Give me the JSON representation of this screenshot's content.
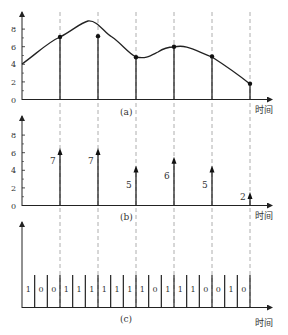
{
  "figure": {
    "x_axis_label": "时间",
    "panels": [
      {
        "id": "a",
        "label": "(a)",
        "type": "continuous analog signal with sample points"
      },
      {
        "id": "b",
        "label": "(b)",
        "type": "sampled values (impulses)"
      },
      {
        "id": "c",
        "label": "(c)",
        "type": "binary encoded bit stream"
      }
    ],
    "y_ticks": [
      "0",
      "2",
      "4",
      "6",
      "8"
    ],
    "samples": [
      7,
      7,
      5,
      6,
      5,
      2
    ],
    "sample_labels": [
      "7",
      "7",
      "5",
      "6",
      "5",
      "2"
    ],
    "bits": [
      "1",
      "0",
      "0",
      "1",
      "1",
      "1",
      "1",
      "1",
      "1",
      "1",
      "0",
      "1",
      "1",
      "1",
      "0",
      "0",
      "1",
      "0"
    ],
    "colors": {
      "line": "#222222",
      "dashed": "#888888",
      "text": "#333333"
    }
  },
  "chart_data": [
    {
      "type": "line",
      "title": "(a)",
      "xlabel": "时间",
      "ylabel": "",
      "ylim": [
        0,
        8.5
      ],
      "y_ticks": [
        0,
        2,
        4,
        6,
        8
      ],
      "curve_approx": [
        {
          "t": 0,
          "y": 4.0
        },
        {
          "t": 1,
          "y": 7.1
        },
        {
          "t": 1.5,
          "y": 7.9
        },
        {
          "t": 2,
          "y": 7.2
        },
        {
          "t": 3,
          "y": 4.8
        },
        {
          "t": 3.5,
          "y": 5.0
        },
        {
          "t": 4,
          "y": 6.0
        },
        {
          "t": 4.4,
          "y": 6.2
        },
        {
          "t": 5,
          "y": 4.9
        },
        {
          "t": 6,
          "y": 1.8
        }
      ],
      "sample_points": [
        {
          "t": 1,
          "y": 7.1
        },
        {
          "t": 2,
          "y": 7.2
        },
        {
          "t": 3,
          "y": 4.8
        },
        {
          "t": 4,
          "y": 6.0
        },
        {
          "t": 5,
          "y": 4.9
        },
        {
          "t": 6,
          "y": 1.8
        }
      ],
      "grid": false
    },
    {
      "type": "bar",
      "title": "(b)",
      "xlabel": "时间",
      "categories": [
        "t1",
        "t2",
        "t3",
        "t4",
        "t5",
        "t6"
      ],
      "values": [
        7,
        7,
        5,
        6,
        5,
        2
      ],
      "ylim": [
        0,
        8.5
      ],
      "y_ticks": [
        0,
        2,
        4,
        6,
        8
      ],
      "grid": false
    },
    {
      "type": "table",
      "title": "(c)",
      "xlabel": "时间",
      "bits": [
        1,
        0,
        0,
        1,
        1,
        1,
        1,
        1,
        1,
        1,
        0,
        1,
        1,
        1,
        0,
        0,
        1,
        0
      ],
      "groups_per_sample": 3
    }
  ]
}
